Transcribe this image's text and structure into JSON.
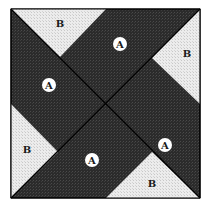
{
  "diagram": {
    "type": "quilt-block",
    "colors": {
      "dark_fabric": "#2b2b2b",
      "light_fabric": "#e6e6e6",
      "seam": "#000000",
      "label_circle": "#ffffff"
    },
    "pieces": [
      {
        "id": "A1",
        "label": "A",
        "fabric": "dark",
        "label_pos": [
          49,
          85
        ]
      },
      {
        "id": "A2",
        "label": "A",
        "fabric": "dark",
        "label_pos": [
          120,
          44
        ]
      },
      {
        "id": "A3",
        "label": "A",
        "fabric": "dark",
        "label_pos": [
          165,
          145
        ]
      },
      {
        "id": "A4",
        "label": "A",
        "fabric": "dark",
        "label_pos": [
          92,
          160
        ]
      },
      {
        "id": "B1",
        "label": "B",
        "fabric": "light",
        "label_pos": [
          60,
          23
        ]
      },
      {
        "id": "B2",
        "label": "B",
        "fabric": "light",
        "label_pos": [
          187,
          53
        ]
      },
      {
        "id": "B3",
        "label": "B",
        "fabric": "light",
        "label_pos": [
          27,
          149
        ]
      },
      {
        "id": "B4",
        "label": "B",
        "fabric": "light",
        "label_pos": [
          152,
          183
        ]
      }
    ]
  }
}
